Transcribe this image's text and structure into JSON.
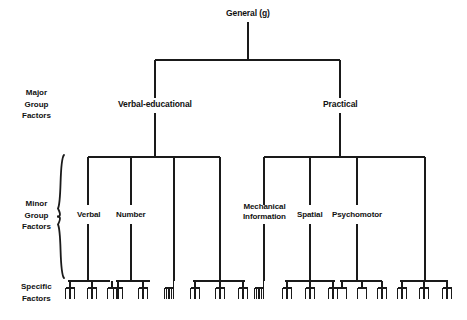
{
  "diagram": {
    "line_color": "#1a1a1a",
    "background": "#ffffff",
    "root": {
      "label": "General (g)",
      "x": 248,
      "y": 14
    },
    "tier_labels": [
      {
        "id": "major",
        "lines": "Major\nGroup\nFactors",
        "x": 36,
        "y": 104
      },
      {
        "id": "minor",
        "lines": "Minor\nGroup\nFactors",
        "x": 36,
        "y": 215
      },
      {
        "id": "specific",
        "lines": "Specific\nFactors",
        "x": 36,
        "y": 292
      }
    ],
    "major_factors": [
      {
        "label": "Verbal-educational",
        "x": 155,
        "y": 105
      },
      {
        "label": "Practical",
        "x": 340,
        "y": 105
      }
    ],
    "minor_factors": [
      {
        "label": "Verbal",
        "x": 88,
        "y": 215,
        "lines": 1
      },
      {
        "label": "Number",
        "x": 131,
        "y": 215,
        "lines": 1
      },
      {
        "label": "",
        "x": 174,
        "y": 215,
        "lines": 0
      },
      {
        "label": "",
        "x": 220,
        "y": 215,
        "lines": 0
      },
      {
        "label": "Mechanical\nInformation",
        "x": 264,
        "y": 212,
        "lines": 2
      },
      {
        "label": "Spatial",
        "x": 310,
        "y": 215,
        "lines": 1
      },
      {
        "label": "Psychomotor",
        "x": 357,
        "y": 215,
        "lines": 1
      },
      {
        "label": "",
        "x": 425,
        "y": 215,
        "lines": 0
      }
    ],
    "brace": {
      "name": "minor-group-brace",
      "x": 58,
      "top": 155,
      "bottom": 278
    },
    "geometry": {
      "root_stem_top": 22,
      "root_stem_bottom": 60,
      "major_bar_y": 60,
      "major_left_x": 155,
      "major_right_x": 340,
      "major_stem_bottom": 98,
      "major_label_gap_top": 98,
      "major_label_gap_bottom": 113,
      "major_stem2_bottom": 157,
      "minor_bar_y": 157,
      "minor_left_group": [
        88,
        131,
        174,
        220
      ],
      "minor_right_group": [
        264,
        310,
        357,
        425
      ],
      "minor_stem_bottom": 205,
      "minor_label_gap_top": 205,
      "minor_label_gap_bottom": 224,
      "minor_stem2_bottom": 281,
      "comb_bar_y": 281,
      "leg_bottom": 296,
      "tooth_top": 288,
      "tooth_bottom": 299
    },
    "specific_groups": [
      {
        "parent": 88,
        "bar_from": 68,
        "bar_to": 110,
        "children": [
          {
            "x": 70,
            "teeth": 3
          },
          {
            "x": 92,
            "teeth": 3
          },
          {
            "x": 112,
            "teeth": 2
          }
        ]
      },
      {
        "parent": 131,
        "bar_from": 116,
        "bar_to": 150,
        "children": [
          {
            "x": 118,
            "teeth": 3
          },
          {
            "x": 143,
            "teeth": 3
          }
        ]
      },
      {
        "parent": 174,
        "bar_from": 174,
        "bar_to": 174,
        "children": [
          {
            "x": 169,
            "teeth": 5
          }
        ]
      },
      {
        "parent": 220,
        "bar_from": 193,
        "bar_to": 245,
        "children": [
          {
            "x": 195,
            "teeth": 3
          },
          {
            "x": 220,
            "teeth": 3
          },
          {
            "x": 243,
            "teeth": 3
          }
        ]
      },
      {
        "parent": 264,
        "bar_from": 264,
        "bar_to": 264,
        "children": [
          {
            "x": 259,
            "teeth": 5
          }
        ]
      },
      {
        "parent": 310,
        "bar_from": 285,
        "bar_to": 335,
        "children": [
          {
            "x": 287,
            "teeth": 3
          },
          {
            "x": 310,
            "teeth": 3
          },
          {
            "x": 333,
            "teeth": 3
          }
        ]
      },
      {
        "parent": 357,
        "bar_from": 340,
        "bar_to": 382,
        "children": [
          {
            "x": 342,
            "teeth": 2
          },
          {
            "x": 362,
            "teeth": 2
          },
          {
            "x": 382,
            "teeth": 3
          }
        ]
      },
      {
        "parent": 425,
        "bar_from": 400,
        "bar_to": 448,
        "children": [
          {
            "x": 402,
            "teeth": 3
          },
          {
            "x": 424,
            "teeth": 3
          },
          {
            "x": 447,
            "teeth": 3
          }
        ]
      }
    ]
  }
}
